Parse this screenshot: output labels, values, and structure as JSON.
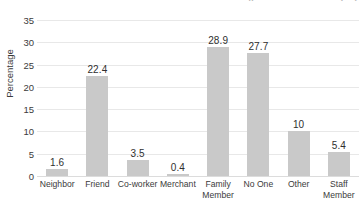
{
  "top_cutoff_text": "(percent of total sample)",
  "chart_data": {
    "type": "bar",
    "title": "",
    "xlabel": "",
    "ylabel": "Percentage",
    "categories": [
      "Neighbor",
      "Friend",
      "Co-worker",
      "Merchant",
      "Family\nMember",
      "No One",
      "Other",
      "Staff\nMember"
    ],
    "values": [
      1.6,
      22.4,
      3.5,
      0.4,
      28.9,
      27.7,
      10,
      5.4
    ],
    "value_labels": [
      "1.6",
      "22.4",
      "3.5",
      "0.4",
      "28.9",
      "27.7",
      "10",
      "5.4"
    ],
    "ylim": [
      0,
      35
    ],
    "ytick_labels": [
      "0",
      "5",
      "10",
      "15",
      "20",
      "25",
      "30",
      "35"
    ],
    "ytick_values": [
      0,
      5,
      10,
      15,
      20,
      25,
      30,
      35
    ],
    "grid": true,
    "legend": "none",
    "bar_color": "#c9c9c9",
    "grid_color": "#e8e8e8",
    "text_color": "#3b3b3b",
    "background": "#ffffff"
  }
}
